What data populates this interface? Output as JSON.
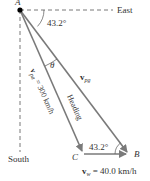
{
  "diagram": {
    "points": {
      "A": {
        "label": "A",
        "x": 20,
        "y": 10
      },
      "B": {
        "label": "B",
        "x": 129,
        "y": 154
      },
      "C": {
        "label": "C",
        "x": 83,
        "y": 154
      }
    },
    "axes": {
      "east_label": "East",
      "south_label": "South"
    },
    "angles": {
      "top_angle": "43.2°",
      "bottom_angle": "43.2°",
      "theta": "θ"
    },
    "vectors": {
      "v_pa": {
        "symbol": "v",
        "subscript": "pa",
        "value_text": " = 300 km/h"
      },
      "v_pg": {
        "symbol": "v",
        "subscript": "pg"
      },
      "heading_label": "Heading",
      "v_w": {
        "symbol": "v",
        "subscript": "w",
        "value_text": " = 40.0 km/h"
      }
    },
    "colors": {
      "vector_stroke": "#7a7a7a",
      "dashed_stroke": "#555555",
      "point_fill": "#000000",
      "text": "#333333"
    }
  }
}
